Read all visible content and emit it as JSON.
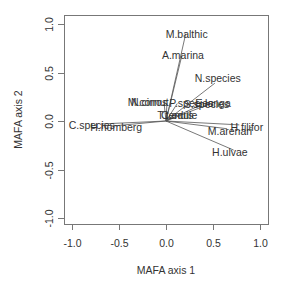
{
  "chart_data": {
    "type": "scatter",
    "subtype": "biplot-vectors",
    "title": "",
    "xlabel": "MAFA axis 1",
    "ylabel": "MAFA axis 2",
    "xlim": [
      -1.0,
      1.0
    ],
    "ylim": [
      -1.0,
      1.0
    ],
    "xticks": [
      "-1.0",
      "-0.5",
      "0.0",
      "0.5",
      "1.0"
    ],
    "yticks": [
      "-1.0",
      "-0.5",
      "0.0",
      "0.5",
      "1.0"
    ],
    "grid": false,
    "legend": "none",
    "vectors": [
      {
        "label": "M.balthic",
        "x": 0.21,
        "y": 0.9
      },
      {
        "label": "A.marina",
        "x": 0.17,
        "y": 0.68
      },
      {
        "label": "N.species",
        "x": 0.52,
        "y": 0.39
      },
      {
        "label": "M.cornut",
        "x": -0.02,
        "y": 0.18
      },
      {
        "label": "N.cirros",
        "x": 0.01,
        "y": 0.18
      },
      {
        "label": "P.species",
        "x": 0.12,
        "y": 0.18
      },
      {
        "label": "S.species",
        "x": 0.38,
        "y": 0.17
      },
      {
        "label": "E.longa",
        "x": 0.45,
        "y": 0.17
      },
      {
        "label": "T.tenuis",
        "x": 0.05,
        "y": 0.06
      },
      {
        "label": "C.edule",
        "x": 0.08,
        "y": 0.05
      },
      {
        "label": "C.species",
        "x": -0.68,
        "y": -0.03
      },
      {
        "label": "H.homberg",
        "x": -0.55,
        "y": -0.05
      },
      {
        "label": "H.filifor",
        "x": 0.78,
        "y": -0.04
      },
      {
        "label": "M.arenari",
        "x": 0.65,
        "y": -0.08
      },
      {
        "label": "H.ulvae",
        "x": 0.72,
        "y": -0.3
      }
    ],
    "label_positions": [
      {
        "label": "M.balthic",
        "x": 0.22,
        "y": 0.9
      },
      {
        "label": "A.marina",
        "x": 0.18,
        "y": 0.68
      },
      {
        "label": "N.species",
        "x": 0.55,
        "y": 0.44
      },
      {
        "label": "M.cornut",
        "x": -0.19,
        "y": 0.2
      },
      {
        "label": "N.cirros",
        "x": -0.18,
        "y": 0.2
      },
      {
        "label": "P.species",
        "x": 0.27,
        "y": 0.19
      },
      {
        "label": "S.species",
        "x": 0.43,
        "y": 0.18
      },
      {
        "label": "E.longa",
        "x": 0.5,
        "y": 0.19
      },
      {
        "label": "T.tenuis",
        "x": 0.1,
        "y": 0.06
      },
      {
        "label": "C.edule",
        "x": 0.14,
        "y": 0.06
      },
      {
        "label": "C.species",
        "x": -0.79,
        "y": -0.04
      },
      {
        "label": "H.homberg",
        "x": -0.53,
        "y": -0.06
      },
      {
        "label": "H.filifor",
        "x": 0.86,
        "y": -0.06
      },
      {
        "label": "M.arenari",
        "x": 0.68,
        "y": -0.1
      },
      {
        "label": "H.ulvae",
        "x": 0.68,
        "y": -0.32
      }
    ]
  },
  "layout": {
    "plot_left": 64,
    "plot_top": 15,
    "plot_right": 268,
    "plot_bottom": 224,
    "x_origin_px": 166,
    "x_unit_px": 94,
    "y_origin_px": 121,
    "y_unit_px": 97
  }
}
